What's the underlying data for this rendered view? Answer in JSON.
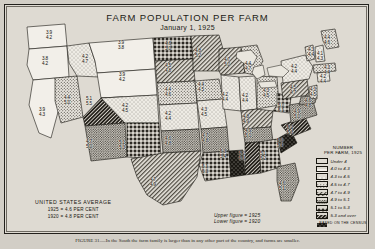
{
  "title": "FARM POPULATION PER FARM",
  "subtitle": "January 1, 1925",
  "average_box": {
    "header": "UNITED STATES AVERAGE",
    "line1": "1925 = 4.6 PER CENT",
    "line2": "1920 = 4.8 PER CENT"
  },
  "figure_note": {
    "upper": "Upper figure = 1925",
    "lower": "Lower figure = 1920"
  },
  "legend": {
    "header_line1": "NUMBER",
    "header_line2": "PER FARM, 1925",
    "basis": "BASED ON THE CENSUS",
    "items": [
      {
        "label": "Under 4",
        "pattern": "white"
      },
      {
        "label": "4.0 to 4.3",
        "pattern": "dots-fine"
      },
      {
        "label": "4.3 to 4.5",
        "pattern": "dots-med"
      },
      {
        "label": "4.5 to 4.7",
        "pattern": "hatch-light"
      },
      {
        "label": "4.7 to 4.9",
        "pattern": "dots-dense"
      },
      {
        "label": "4.9 to 5.1",
        "pattern": "stars"
      },
      {
        "label": "5.1 to 5.3",
        "pattern": "hatch-dark"
      },
      {
        "label": "5.3 and over",
        "pattern": "solid-black"
      }
    ]
  },
  "caption": "FIGURE 31.—In the South the farm family is larger than in any other part of the country, and farms are smaller.",
  "chart_data": {
    "type": "map",
    "title": "FARM POPULATION PER FARM",
    "subtitle": "January 1, 1925",
    "unit": "persons per farm",
    "legend_bins": [
      "Under 4",
      "4.0 to 4.3",
      "4.3 to 4.5",
      "4.5 to 4.7",
      "4.7 to 4.9",
      "4.9 to 5.1",
      "5.1 to 5.3",
      "5.3 and over"
    ],
    "us_average_1925": 4.6,
    "us_average_1920": 4.8,
    "states": [
      {
        "code": "WA",
        "v1925": "3.9",
        "v1920": "4.2",
        "pattern": "white",
        "x": 44,
        "y": 31
      },
      {
        "code": "OR",
        "v1925": "3.8",
        "v1920": "4.2",
        "pattern": "white",
        "x": 40,
        "y": 57
      },
      {
        "code": "CA",
        "v1925": "3.9",
        "v1920": "4.3",
        "pattern": "white",
        "x": 37,
        "y": 108
      },
      {
        "code": "NV",
        "v1925": "4.4",
        "v1920": "5.0",
        "pattern": "dots-med",
        "x": 62,
        "y": 96
      },
      {
        "code": "ID",
        "v1925": "4.2",
        "v1920": "4.7",
        "pattern": "dots-fine",
        "x": 80,
        "y": 55
      },
      {
        "code": "MT",
        "v1925": "3.9",
        "v1920": "3.8",
        "pattern": "white",
        "x": 116,
        "y": 41
      },
      {
        "code": "WY",
        "v1925": "3.9",
        "v1920": "4.2",
        "pattern": "white",
        "x": 117,
        "y": 73
      },
      {
        "code": "UT",
        "v1925": "5.1",
        "v1920": "5.5",
        "pattern": "hatch-dark",
        "x": 84,
        "y": 97
      },
      {
        "code": "AZ",
        "v1925": "4.7",
        "v1920": "5.0",
        "pattern": "dots-dense",
        "x": 84,
        "y": 140
      },
      {
        "code": "CO",
        "v1925": "4.2",
        "v1920": "4.5",
        "pattern": "dots-fine",
        "x": 120,
        "y": 104
      },
      {
        "code": "NM",
        "v1925": "5.1",
        "v1920": "5.3",
        "pattern": "stars",
        "x": 117,
        "y": 141
      },
      {
        "code": "ND",
        "v1925": "4.6",
        "v1920": "5.0",
        "pattern": "stars",
        "x": 163,
        "y": 42
      },
      {
        "code": "SD",
        "v1925": "4.5",
        "v1920": "4.8",
        "pattern": "hatch-light",
        "x": 163,
        "y": 64
      },
      {
        "code": "NE",
        "v1925": "4.4",
        "v1920": "4.6",
        "pattern": "dots-med",
        "x": 163,
        "y": 88
      },
      {
        "code": "KS",
        "v1925": "4.2",
        "v1920": "4.4",
        "pattern": "dots-fine",
        "x": 163,
        "y": 112
      },
      {
        "code": "OK",
        "v1925": "4.6",
        "v1920": "4.8",
        "pattern": "dots-dense",
        "x": 163,
        "y": 137
      },
      {
        "code": "TX",
        "v1925": "4.7",
        "v1920": "4.9",
        "pattern": "hatch-light",
        "x": 148,
        "y": 178
      },
      {
        "code": "MN",
        "v1925": "4.8",
        "v1920": "5.2",
        "pattern": "hatch-light",
        "x": 193,
        "y": 49
      },
      {
        "code": "IA",
        "v1925": "4.4",
        "v1920": "4.5",
        "pattern": "dots-med",
        "x": 196,
        "y": 83
      },
      {
        "code": "MO",
        "v1925": "4.3",
        "v1920": "4.5",
        "pattern": "dots-fine",
        "x": 199,
        "y": 108
      },
      {
        "code": "AR",
        "v1925": "4.7",
        "v1920": "4.8",
        "pattern": "dots-dense",
        "x": 200,
        "y": 134
      },
      {
        "code": "LA",
        "v1925": "5.1",
        "v1920": "5.3",
        "pattern": "stars",
        "x": 200,
        "y": 165
      },
      {
        "code": "WI",
        "v1925": "4.7",
        "v1920": "5.0",
        "pattern": "hatch-light",
        "x": 222,
        "y": 58
      },
      {
        "code": "IL",
        "v1925": "4.2",
        "v1920": "4.4",
        "pattern": "dots-fine",
        "x": 220,
        "y": 93
      },
      {
        "code": "MS",
        "v1925": "5.3",
        "v1920": "5.4",
        "pattern": "solid-black",
        "x": 218,
        "y": 150
      },
      {
        "code": "MI",
        "v1925": "4.4",
        "v1920": "4.7",
        "pattern": "dots-med",
        "x": 243,
        "y": 62
      },
      {
        "code": "IN",
        "v1925": "4.2",
        "v1920": "4.4",
        "pattern": "dots-fine",
        "x": 240,
        "y": 94
      },
      {
        "code": "KY",
        "v1925": "4.8",
        "v1920": "4.9",
        "pattern": "hatch-light",
        "x": 241,
        "y": 115
      },
      {
        "code": "TN",
        "v1925": "4.9",
        "v1920": "5.0",
        "pattern": "dots-dense",
        "x": 243,
        "y": 129
      },
      {
        "code": "AL",
        "v1925": "5.2",
        "v1920": "5.3",
        "pattern": "hatch-dark",
        "x": 237,
        "y": 152
      },
      {
        "code": "OH",
        "v1925": "4.3",
        "v1920": "4.5",
        "pattern": "dots-med",
        "x": 261,
        "y": 89
      },
      {
        "code": "GA",
        "v1925": "5.1",
        "v1920": "5.2",
        "pattern": "stars",
        "x": 258,
        "y": 152
      },
      {
        "code": "FL",
        "v1925": "4.6",
        "v1920": "5.1",
        "pattern": "dots-dense",
        "x": 277,
        "y": 182
      },
      {
        "code": "WV",
        "v1925": "5.0",
        "v1920": "5.1",
        "pattern": "stars",
        "x": 276,
        "y": 104
      },
      {
        "code": "SC",
        "v1925": "5.3",
        "v1920": "5.4",
        "pattern": "solid-black",
        "x": 275,
        "y": 139
      },
      {
        "code": "NC",
        "v1925": "5.2",
        "v1920": "5.3",
        "pattern": "hatch-dark",
        "x": 285,
        "y": 126
      },
      {
        "code": "VA",
        "v1925": "4.9",
        "v1920": "5.0",
        "pattern": "dots-dense",
        "x": 292,
        "y": 110
      },
      {
        "code": "PA",
        "v1925": "4.5",
        "v1920": "4.7",
        "pattern": "hatch-light",
        "x": 288,
        "y": 86
      },
      {
        "code": "NY",
        "v1925": "4.2",
        "v1920": "4.4",
        "pattern": "dots-fine",
        "x": 289,
        "y": 65
      },
      {
        "code": "MD",
        "v1925": "4.6",
        "v1920": "4.8",
        "pattern": "dots-dense",
        "x": 303,
        "y": 99
      },
      {
        "code": "NJ",
        "v1925": "4.3",
        "v1920": "4.5",
        "pattern": "dots-med",
        "x": 308,
        "y": 88
      },
      {
        "code": "VT",
        "v1925": "4.3",
        "v1920": "4.4",
        "pattern": "dots-med",
        "x": 306,
        "y": 48
      },
      {
        "code": "NH",
        "v1925": "4.1",
        "v1920": "4.3",
        "pattern": "dots-fine",
        "x": 315,
        "y": 52
      },
      {
        "code": "ME",
        "v1925": "4.4",
        "v1920": "4.6",
        "pattern": "dots-med",
        "x": 322,
        "y": 36
      },
      {
        "code": "MA",
        "v1925": "4.3",
        "v1920": "4.4",
        "pattern": "dots-med",
        "x": 322,
        "y": 66
      },
      {
        "code": "CT",
        "v1925": "4.2",
        "v1920": "4.4",
        "pattern": "dots-fine",
        "x": 318,
        "y": 75
      }
    ]
  }
}
